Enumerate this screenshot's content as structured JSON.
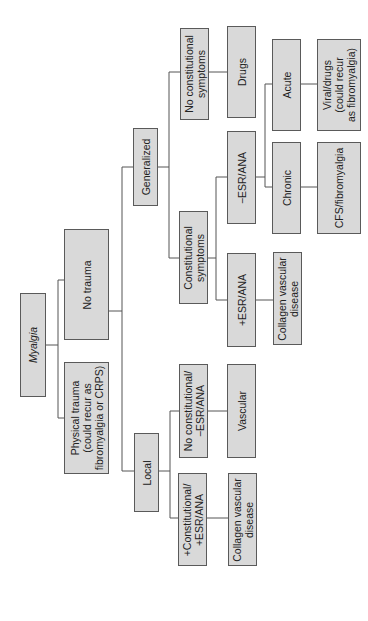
{
  "diagram": {
    "type": "decision-tree",
    "orientation": "rotated-90-ccw",
    "root": "Myalgia",
    "nodes": [
      {
        "id": "myalgia",
        "label": "Myalgia",
        "italic": true,
        "x": 20,
        "y": 293,
        "w": 26,
        "h": 104
      },
      {
        "id": "no_trauma",
        "label": "No trauma",
        "x": 64,
        "y": 229,
        "w": 45,
        "h": 111
      },
      {
        "id": "physical_trauma",
        "label": "Physical trauma\n(could recur as\nfibromyalgia or CRPS)",
        "x": 64,
        "y": 362,
        "w": 45,
        "h": 112
      },
      {
        "id": "generalized",
        "label": "Generalized",
        "x": 133,
        "y": 128,
        "w": 25,
        "h": 78
      },
      {
        "id": "local",
        "label": "Local",
        "x": 134,
        "y": 433,
        "w": 25,
        "h": 79
      },
      {
        "id": "no_const_symptoms",
        "label": "No constitutional\nsymptoms",
        "x": 180,
        "y": 28,
        "w": 29,
        "h": 92
      },
      {
        "id": "drugs",
        "label": "Drugs",
        "x": 227,
        "y": 26,
        "w": 29,
        "h": 92
      },
      {
        "id": "acute",
        "label": "Acute",
        "x": 272,
        "y": 39,
        "w": 29,
        "h": 92
      },
      {
        "id": "viral_drugs",
        "label": "Viral/drugs\n(could recur\nas fibromyalgia)",
        "x": 317,
        "y": 39,
        "w": 44,
        "h": 92
      },
      {
        "id": "neg_esr_ana",
        "label": "−ESR/ANA",
        "x": 227,
        "y": 131,
        "w": 29,
        "h": 93
      },
      {
        "id": "chronic",
        "label": "Chronic",
        "x": 272,
        "y": 142,
        "w": 29,
        "h": 92
      },
      {
        "id": "cfs_fibro",
        "label": "CFS/fibromyalgia",
        "x": 317,
        "y": 142,
        "w": 44,
        "h": 92
      },
      {
        "id": "const_symptoms",
        "label": "Constitutional\nsymptoms",
        "x": 179,
        "y": 211,
        "w": 29,
        "h": 93
      },
      {
        "id": "pos_esr_ana",
        "label": "+ESR/ANA",
        "x": 227,
        "y": 253,
        "w": 29,
        "h": 94
      },
      {
        "id": "cvd_gen",
        "label": "Collagen vascular\ndisease",
        "x": 273,
        "y": 252,
        "w": 29,
        "h": 93
      },
      {
        "id": "no_const_neg",
        "label": "No constitutional/\n−ESR/ANA",
        "x": 179,
        "y": 364,
        "w": 29,
        "h": 94
      },
      {
        "id": "vascular",
        "label": "Vascular",
        "x": 227,
        "y": 364,
        "w": 29,
        "h": 94
      },
      {
        "id": "const_pos",
        "label": "+Constitutional/\n+ESR/ANA",
        "x": 178,
        "y": 473,
        "w": 29,
        "h": 93
      },
      {
        "id": "cvd_local",
        "label": "Collagen vascular\ndisease",
        "x": 228,
        "y": 473,
        "w": 29,
        "h": 93
      }
    ],
    "edges": [
      [
        "myalgia",
        "no_trauma"
      ],
      [
        "myalgia",
        "physical_trauma"
      ],
      [
        "no_trauma",
        "generalized"
      ],
      [
        "no_trauma",
        "local"
      ],
      [
        "generalized",
        "no_const_symptoms"
      ],
      [
        "generalized",
        "const_symptoms"
      ],
      [
        "no_const_symptoms",
        "drugs"
      ],
      [
        "const_symptoms",
        "neg_esr_ana"
      ],
      [
        "const_symptoms",
        "pos_esr_ana"
      ],
      [
        "neg_esr_ana",
        "acute"
      ],
      [
        "neg_esr_ana",
        "chronic"
      ],
      [
        "acute",
        "viral_drugs"
      ],
      [
        "chronic",
        "cfs_fibro"
      ],
      [
        "pos_esr_ana",
        "cvd_gen"
      ],
      [
        "local",
        "no_const_neg"
      ],
      [
        "local",
        "const_pos"
      ],
      [
        "no_const_neg",
        "vascular"
      ],
      [
        "const_pos",
        "cvd_local"
      ]
    ],
    "colors": {
      "box_fill": "#d9d9d9",
      "box_border": "#5a5a5a",
      "line": "#555555",
      "background": "#ffffff"
    }
  }
}
